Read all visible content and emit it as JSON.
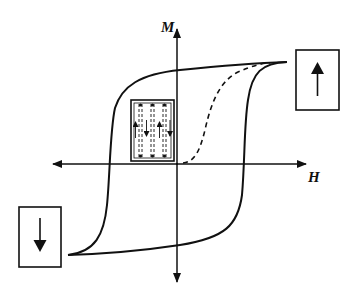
{
  "diagram": {
    "type": "magnetic hysteresis loop",
    "axes": {
      "x_label": "H",
      "y_label": "M"
    },
    "elements": [
      {
        "name": "hysteresis-loop",
        "style": "solid"
      },
      {
        "name": "initial-magnetization-curve",
        "style": "dashed"
      },
      {
        "name": "saturation-up-box",
        "content": "up arrow",
        "position": "upper right"
      },
      {
        "name": "saturation-down-box",
        "content": "down arrow",
        "position": "lower left"
      },
      {
        "name": "domain-structure-box",
        "content": "alternating up/down domains separated by dashed walls",
        "position": "upper left quadrant near origin"
      }
    ],
    "colors": {
      "line": "#111111",
      "background": "#ffffff"
    }
  }
}
